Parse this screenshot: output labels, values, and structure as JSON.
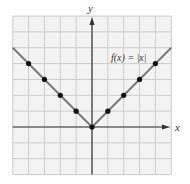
{
  "chart_data": {
    "type": "line",
    "title": "",
    "function_label": "f(x) = |x|",
    "xlabel": "x",
    "ylabel": "y",
    "xlim": [
      -5,
      5
    ],
    "ylim": [
      -3,
      7
    ],
    "grid": true,
    "series": [
      {
        "name": "f(x) = |x|",
        "line_x": [
          -5,
          0,
          5
        ],
        "line_y": [
          5,
          0,
          5
        ],
        "points_x": [
          -4,
          -3,
          -2,
          -1,
          0,
          1,
          2,
          3,
          4
        ],
        "points_y": [
          4,
          3,
          2,
          1,
          0,
          1,
          2,
          3,
          4
        ]
      }
    ],
    "colors": {
      "grid_background": "#f3f3f3",
      "grid_line": "#cdcdcd",
      "axis": "#333333",
      "function_line": "#7a7a7a",
      "points": "#111111"
    }
  }
}
